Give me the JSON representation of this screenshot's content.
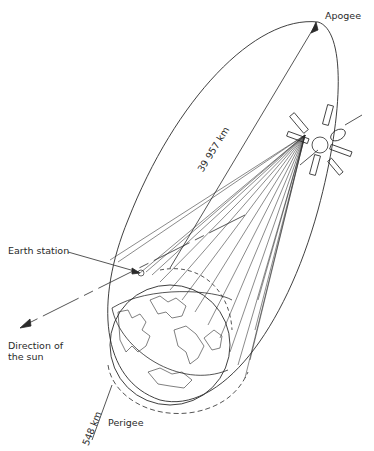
{
  "labels": {
    "apogee": "Apogee",
    "earth_station": "Earth station",
    "direction_sun_line1": "Direction of",
    "direction_sun_line2": "the sun",
    "perigee": "Perigee",
    "apogee_distance": "39 957 km",
    "perigee_distance": "548 km"
  },
  "colors": {
    "ink": "#2a2a2a",
    "background": "#ffffff"
  }
}
